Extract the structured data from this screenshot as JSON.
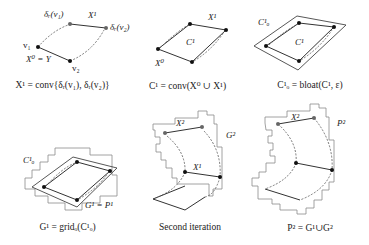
{
  "panels": [
    {
      "id": "panel-1",
      "caption": "X¹ = conv{δᵣ(v₁), δᵣ(v₂)}",
      "labels": {
        "delta_v1": "δᵣ(v₁)",
        "x1": "X¹",
        "delta_v2": "δᵣ(v₂)",
        "v1": "v₁",
        "v2": "v₂",
        "x0_eq_y": "X⁰ = Y"
      }
    },
    {
      "id": "panel-2",
      "caption": "C¹ = conv(X⁰ ∪ X¹)",
      "labels": {
        "x1": "X¹",
        "c1": "C¹",
        "x0": "X⁰"
      }
    },
    {
      "id": "panel-3",
      "caption": "C¹ₒ = bloat(C¹, ε)",
      "labels": {
        "c1o": "C¹ₒ",
        "c1": "C¹"
      }
    },
    {
      "id": "panel-4",
      "caption": "G¹ = gridₒ(C¹ₒ)",
      "labels": {
        "c1o": "C¹ₒ",
        "g1_eq_p1": "G¹ = P¹"
      }
    },
    {
      "id": "panel-5",
      "caption": "Second iteration",
      "labels": {
        "x2": "X²",
        "g2": "G²",
        "x1": "X¹"
      }
    },
    {
      "id": "panel-6",
      "caption": "P² = G¹∪G²",
      "labels": {
        "x2": "X²",
        "p2": "P²"
      }
    }
  ],
  "colors": {
    "line": "#333333",
    "grid": "#8a8a8a",
    "point": "#111111",
    "point_gray": "#666666"
  }
}
